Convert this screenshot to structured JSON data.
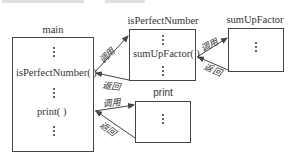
{
  "diagram": {
    "functions": {
      "main": {
        "title": "main",
        "calls": [
          "isPerfectNumber( )",
          "print( )"
        ]
      },
      "isPerfectNumber": {
        "title": "isPerfectNumber",
        "calls": [
          "sumUpFactor( )"
        ]
      },
      "sumUpFactor": {
        "title": "sumUpFactor"
      },
      "print": {
        "title": "print"
      }
    },
    "edge_labels": {
      "call": "调用",
      "return": "返回"
    },
    "edges": [
      {
        "from": "main",
        "to": "isPerfectNumber",
        "label": "调用"
      },
      {
        "from": "isPerfectNumber",
        "to": "main",
        "label": "返回"
      },
      {
        "from": "isPerfectNumber",
        "to": "sumUpFactor",
        "label": "调用"
      },
      {
        "from": "sumUpFactor",
        "to": "isPerfectNumber",
        "label": "返回"
      },
      {
        "from": "main",
        "to": "print",
        "label": "调用"
      },
      {
        "from": "print",
        "to": "main",
        "label": "返回"
      }
    ],
    "line_color": "#444444"
  }
}
